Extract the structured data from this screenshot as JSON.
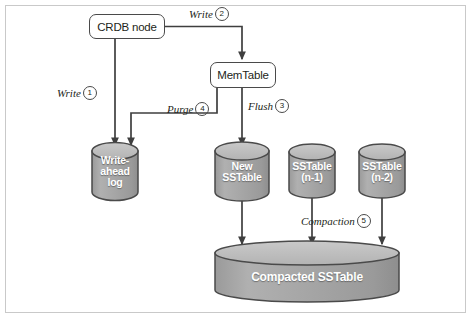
{
  "figure": {
    "colors": {
      "cylinder_body": "#a6a6a6",
      "cylinder_top": "#c2c2c2",
      "cylinder_stroke": "#4a4a4a",
      "line": "#3f3f3f",
      "box_stroke": "#4a4a4a",
      "frame": "#c9c9c9",
      "background": "#ffffff",
      "label_text": "#231f20",
      "cylinder_text": "#ffffff"
    }
  },
  "nodes": {
    "crdb_node": {
      "label": "CRDB node"
    },
    "memtable": {
      "label": "MemTable"
    }
  },
  "stores": [
    {
      "id": "wal",
      "label_lines": [
        "Write-",
        "ahead",
        "log"
      ]
    },
    {
      "id": "new_sstable",
      "label_lines": [
        "New",
        "SSTable"
      ]
    },
    {
      "id": "sstable_n1",
      "label_lines": [
        "SSTable",
        "(n-1)"
      ]
    },
    {
      "id": "sstable_n2",
      "label_lines": [
        "SSTable",
        "(n-2)"
      ]
    },
    {
      "id": "compacted",
      "label_lines": [
        "Compacted SSTable"
      ]
    }
  ],
  "edges": [
    {
      "id": "write1",
      "label": "Write",
      "step": "1",
      "from": "crdb_node",
      "to": "wal"
    },
    {
      "id": "write2",
      "label": "Write",
      "step": "2",
      "from": "crdb_node",
      "to": "memtable"
    },
    {
      "id": "flush3",
      "label": "Flush",
      "step": "3",
      "from": "memtable",
      "to": "new_sstable"
    },
    {
      "id": "purge4",
      "label": "Purge",
      "step": "4",
      "from": "memtable",
      "to": "wal"
    },
    {
      "id": "compaction5",
      "label": "Compaction",
      "step": "5",
      "from": "sstable_n1",
      "to": "compacted"
    }
  ]
}
